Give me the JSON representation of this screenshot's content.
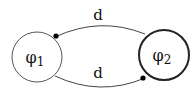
{
  "diagram": {
    "type": "state-graph",
    "nodes": [
      {
        "id": "phi1",
        "label": "φ",
        "subscript": "1",
        "border": "thin"
      },
      {
        "id": "phi2",
        "label": "φ",
        "subscript": "2",
        "border": "thick"
      }
    ],
    "edges": [
      {
        "from": "phi2",
        "to": "phi1",
        "label": "d",
        "position": "top",
        "arrowhead": "filled-dot"
      },
      {
        "from": "phi1",
        "to": "phi2",
        "label": "d",
        "position": "bottom",
        "arrowhead": "filled-dot"
      }
    ],
    "colors": {
      "stroke": "#333333",
      "fill": "#ffffff",
      "text": "#111111"
    }
  }
}
